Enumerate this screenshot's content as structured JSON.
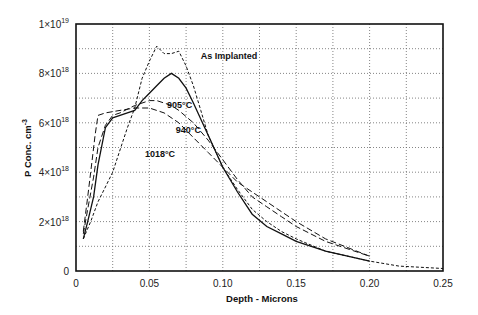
{
  "chart_data": {
    "type": "line",
    "title": "",
    "xlabel": "Depth - Microns",
    "ylabel": "P Conc. cm⁻³",
    "xlim": [
      0,
      0.25
    ],
    "ylim": [
      0,
      1e+19
    ],
    "grid": true,
    "legend_position": "inline labels",
    "x_ticks": [
      "0",
      "0.05",
      "0.10",
      "0.15",
      "0.20",
      "0.25"
    ],
    "y_ticks": [
      "0",
      "2×10¹⁸",
      "4×10¹⁸",
      "6×10¹⁸",
      "8×10¹⁸",
      "1×10¹⁹"
    ],
    "y_units_note": "series values in units of 1e18 cm^-3",
    "series": [
      {
        "name": "As Implanted",
        "style": "short-dash",
        "x": [
          0.005,
          0.01,
          0.015,
          0.02,
          0.025,
          0.03,
          0.035,
          0.04,
          0.045,
          0.05,
          0.055,
          0.06,
          0.065,
          0.07,
          0.075,
          0.08,
          0.085,
          0.09,
          0.1,
          0.11,
          0.12,
          0.13,
          0.14,
          0.15,
          0.17,
          0.2,
          0.22,
          0.25
        ],
        "values": [
          1.3,
          2.0,
          2.8,
          3.4,
          4.0,
          4.9,
          5.8,
          6.6,
          7.8,
          8.5,
          9.1,
          8.8,
          8.8,
          8.9,
          8.3,
          7.5,
          6.5,
          5.5,
          4.2,
          3.3,
          2.5,
          2.0,
          1.6,
          1.3,
          0.8,
          0.4,
          0.2,
          0.1
        ]
      },
      {
        "name": "905°C",
        "style": "solid",
        "x": [
          0.005,
          0.008,
          0.012,
          0.015,
          0.02,
          0.025,
          0.03,
          0.035,
          0.04,
          0.045,
          0.05,
          0.055,
          0.06,
          0.065,
          0.07,
          0.075,
          0.08,
          0.09,
          0.1,
          0.11,
          0.12,
          0.13,
          0.14,
          0.15,
          0.17,
          0.2
        ],
        "values": [
          1.3,
          2.0,
          3.0,
          4.3,
          5.8,
          6.2,
          6.3,
          6.4,
          6.5,
          6.9,
          7.2,
          7.5,
          7.8,
          8.0,
          7.8,
          7.4,
          6.8,
          5.5,
          4.2,
          3.2,
          2.3,
          1.8,
          1.5,
          1.2,
          0.8,
          0.4
        ]
      },
      {
        "name": "940°C",
        "style": "long-dash",
        "x": [
          0.005,
          0.008,
          0.012,
          0.015,
          0.02,
          0.025,
          0.03,
          0.04,
          0.05,
          0.055,
          0.06,
          0.065,
          0.07,
          0.08,
          0.09,
          0.1,
          0.11,
          0.12,
          0.13,
          0.14,
          0.15,
          0.17,
          0.2
        ],
        "values": [
          1.5,
          2.5,
          3.8,
          5.0,
          5.9,
          6.3,
          6.4,
          6.7,
          6.9,
          6.9,
          6.8,
          6.7,
          6.5,
          6.0,
          5.3,
          4.5,
          3.7,
          3.0,
          2.6,
          2.2,
          1.8,
          1.2,
          0.6
        ]
      },
      {
        "name": "1018°C",
        "style": "long-dash",
        "x": [
          0.005,
          0.008,
          0.01,
          0.013,
          0.015,
          0.02,
          0.03,
          0.04,
          0.05,
          0.06,
          0.07,
          0.08,
          0.09,
          0.1,
          0.11,
          0.12,
          0.13,
          0.14,
          0.15,
          0.17,
          0.2
        ],
        "values": [
          1.6,
          3.0,
          4.0,
          5.5,
          6.3,
          6.4,
          6.5,
          6.6,
          6.6,
          6.4,
          6.0,
          5.4,
          4.8,
          4.2,
          3.6,
          3.2,
          2.8,
          2.4,
          2.0,
          1.3,
          0.6
        ]
      }
    ],
    "annotations": [
      {
        "text": "As Implanted",
        "x": 0.085,
        "y": 8.6
      },
      {
        "text": "905°C",
        "x": 0.062,
        "y": 6.6
      },
      {
        "text": "940°C",
        "x": 0.068,
        "y": 5.6
      },
      {
        "text": "1018°C",
        "x": 0.047,
        "y": 4.6
      }
    ]
  },
  "labels": {
    "xlabel": "Depth - Microns",
    "ylabel_main": "P Conc. cm",
    "ylabel_sup": "-3",
    "y_ticks": [
      {
        "base": "0",
        "exp": ""
      },
      {
        "base": "2×10",
        "exp": "18"
      },
      {
        "base": "4×10",
        "exp": "18"
      },
      {
        "base": "6×10",
        "exp": "18"
      },
      {
        "base": "8×10",
        "exp": "18"
      },
      {
        "base": "1×10",
        "exp": "19"
      }
    ],
    "x_ticks": [
      "0",
      "0.05",
      "0.10",
      "0.15",
      "0.20",
      "0.25"
    ]
  }
}
